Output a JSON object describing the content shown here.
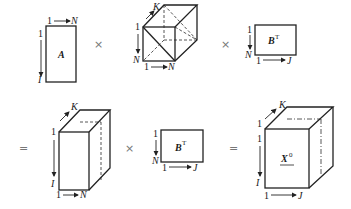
{
  "equation": {
    "row1": {
      "matrix_A": {
        "label": "A",
        "top_start": "1",
        "top_end": "N",
        "left_start": "1",
        "left_end": "I"
      },
      "op1": "×",
      "tensor_cube": {
        "depth_label": "K",
        "left_start": "1",
        "left_end": "N",
        "bottom_start": "1",
        "bottom_end": "N"
      },
      "op2": "×",
      "matrix_BT": {
        "label": "B",
        "superscript": "T",
        "left_start": "1",
        "left_end": "N",
        "bottom_start": "1",
        "bottom_end": "J"
      }
    },
    "row2": {
      "eq1": "=",
      "tensor_tall": {
        "depth_label": "K",
        "left_start": "1",
        "left_end": "I",
        "bottom_start": "1",
        "bottom_end": "N"
      },
      "op3": "×",
      "matrix_BT": {
        "label": "B",
        "superscript": "T",
        "left_start": "1",
        "left_end": "N",
        "bottom_start": "1",
        "bottom_end": "J"
      },
      "eq2": "=",
      "tensor_X": {
        "label": "X",
        "superscript": "0",
        "depth_start": "1",
        "depth_label": "K",
        "left_start": "1",
        "left_end": "I",
        "bottom_start": "1",
        "bottom_end": "J"
      }
    }
  }
}
